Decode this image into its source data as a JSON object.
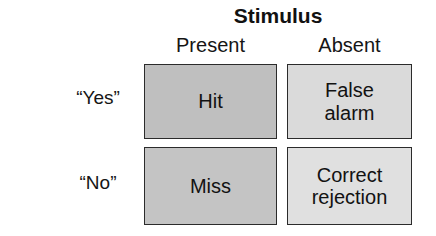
{
  "diagram": {
    "type": "2x2-confusion-matrix",
    "column_axis_title": "Stimulus",
    "row_axis_title_line1": "Participant's",
    "row_axis_title_line2": "response",
    "columns": [
      {
        "key": "present",
        "label": "Present"
      },
      {
        "key": "absent",
        "label": "Absent"
      }
    ],
    "rows": [
      {
        "key": "yes",
        "label": "“Yes”"
      },
      {
        "key": "no",
        "label": "“No”"
      }
    ],
    "cells": [
      {
        "key": "hit",
        "row": "yes",
        "column": "present",
        "line1": "Hit",
        "line2": "",
        "fill": "#bfbfbf",
        "border": "#2b2b2b"
      },
      {
        "key": "false-alarm",
        "row": "yes",
        "column": "absent",
        "line1": "False",
        "line2": "alarm",
        "fill": "#dadada",
        "border": "#2b2b2b"
      },
      {
        "key": "miss",
        "row": "no",
        "column": "present",
        "line1": "Miss",
        "line2": "",
        "fill": "#c4c4c4",
        "border": "#2b2b2b"
      },
      {
        "key": "correct-rejection",
        "row": "no",
        "column": "absent",
        "line1": "Correct",
        "line2": "rejection",
        "fill": "#e0e0e0",
        "border": "#2b2b2b"
      }
    ],
    "background": "#ffffff",
    "text_color": "#121212"
  }
}
